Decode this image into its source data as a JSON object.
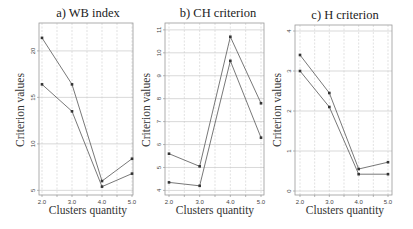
{
  "chart_data": [
    {
      "type": "line",
      "title": "a) WB index",
      "xlabel": "Clusters quantity",
      "ylabel": "Criterion values",
      "x": [
        2.0,
        3.0,
        4.0,
        5.0
      ],
      "x_tick_labels": [
        "2.0",
        "3.0",
        "4.0",
        "5.0"
      ],
      "y_ticks": [
        5,
        10,
        15,
        20
      ],
      "y_tick_labels": [
        "5",
        "10",
        "15",
        "20"
      ],
      "ylim": [
        4.5,
        23
      ],
      "grid": true,
      "series": [
        {
          "name": "series-1",
          "values": [
            21.4,
            16.4,
            6.0,
            8.4
          ]
        },
        {
          "name": "series-2",
          "values": [
            16.4,
            13.5,
            5.4,
            6.8
          ]
        }
      ]
    },
    {
      "type": "line",
      "title": "b) CH criterion",
      "xlabel": "Clusters quantity",
      "ylabel": "Criterion values",
      "x": [
        2.0,
        3.0,
        4.0,
        5.0
      ],
      "x_tick_labels": [
        "2.0",
        "3.0",
        "4.0",
        "5.0"
      ],
      "y_ticks": [
        4,
        5,
        6,
        7,
        8,
        9,
        10,
        11
      ],
      "y_tick_labels": [
        "4",
        "5",
        "6",
        "7",
        "8",
        "9",
        "10",
        "11"
      ],
      "ylim": [
        3.8,
        11.3
      ],
      "grid": true,
      "series": [
        {
          "name": "series-1",
          "values": [
            5.6,
            5.05,
            10.7,
            7.8
          ]
        },
        {
          "name": "series-2",
          "values": [
            4.35,
            4.2,
            9.65,
            6.3
          ]
        }
      ]
    },
    {
      "type": "line",
      "title": "c) H criterion",
      "xlabel": "Clusters quantity",
      "ylabel": "Criterion values",
      "x": [
        2.0,
        3.0,
        4.0,
        5.0
      ],
      "x_tick_labels": [
        "2.0",
        "3.0",
        "4.0",
        "5.0"
      ],
      "y_ticks": [
        0,
        1,
        2,
        3,
        4
      ],
      "y_tick_labels": [
        "0",
        "1",
        "2",
        "3",
        "4"
      ],
      "ylim": [
        -0.1,
        4.15
      ],
      "grid": true,
      "series": [
        {
          "name": "series-1",
          "values": [
            3.4,
            2.45,
            0.55,
            0.72
          ]
        },
        {
          "name": "series-2",
          "values": [
            3.0,
            2.1,
            0.42,
            0.42
          ]
        }
      ]
    }
  ],
  "panels": [
    {
      "title": "a) WB index",
      "xlabel": "Clusters quantity",
      "ylabel": "Criterion values"
    },
    {
      "title": "b) CH criterion",
      "xlabel": "Clusters quantity",
      "ylabel": "Criterion values"
    },
    {
      "title": "c) H criterion",
      "xlabel": "Clusters quantity",
      "ylabel": "Criterion values"
    }
  ],
  "colors": {
    "line": "#555555",
    "marker": "#333333",
    "grid": "#cfcfcf",
    "frame": "#9a9a9a"
  }
}
